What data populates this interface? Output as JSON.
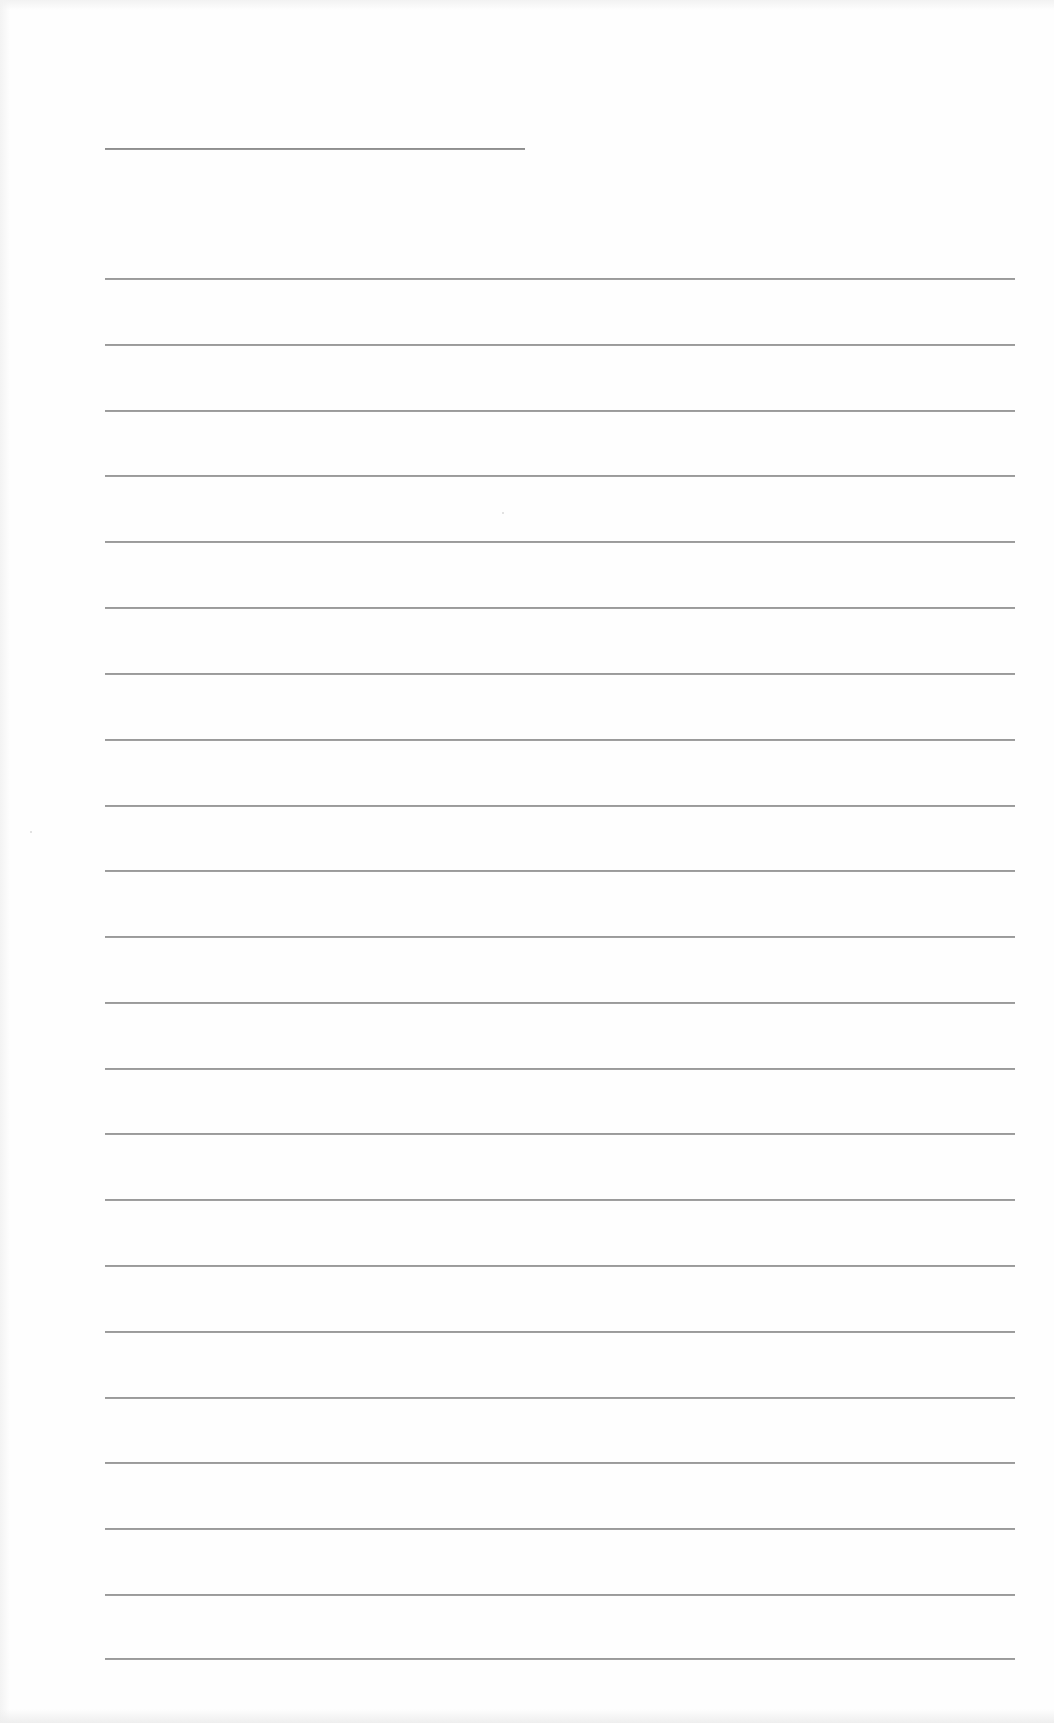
{
  "page": {
    "type": "blank ruled sheet",
    "background": "#fefefe",
    "line_color": "#9a9a9a"
  },
  "title_line": {
    "x": 105,
    "y": 148,
    "width": 420
  },
  "ruled_lines": {
    "x": 105,
    "width": 910,
    "count": 22,
    "positions_y": [
      278,
      344,
      410,
      475,
      541,
      607,
      673,
      739,
      805,
      870,
      936,
      1002,
      1068,
      1133,
      1199,
      1265,
      1331,
      1397,
      1462,
      1528,
      1594,
      1658
    ]
  },
  "specks": [
    {
      "x": 30,
      "y": 831
    },
    {
      "x": 502,
      "y": 512
    }
  ]
}
